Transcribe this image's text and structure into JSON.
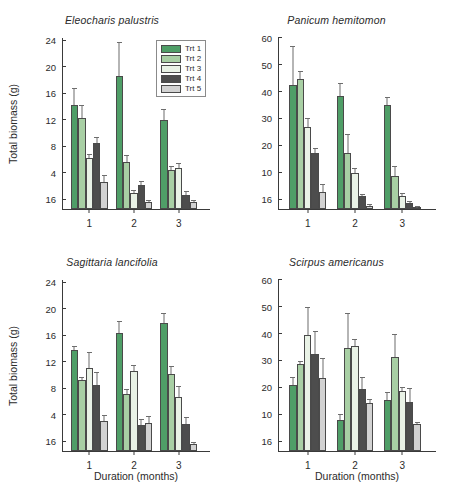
{
  "figure": {
    "legend": {
      "position": "top-right-of-first-panel",
      "entries": [
        {
          "label": "Trt 1",
          "color": "#4f9e67"
        },
        {
          "label": "Trt 2",
          "color": "#a8cfa4"
        },
        {
          "label": "Trt 3",
          "color": "#e9f2e6"
        },
        {
          "label": "Trt 4",
          "color": "#4d4d4d"
        },
        {
          "label": "Trt 5",
          "color": "#d2d2d2"
        }
      ]
    },
    "colors": {
      "trt1": "#4f9e67",
      "trt2": "#a8cfa4",
      "trt3": "#e9f2e6",
      "trt4": "#4d4d4d",
      "trt5": "#d2d2d2",
      "axis": "#3a3a3a",
      "error_bar": "#6d6d6d",
      "background": "#ffffff"
    }
  },
  "chart_data": [
    {
      "type": "bar",
      "panel": "top-left",
      "title": "Eleocharis palustris",
      "xlabel": "",
      "ylabel": "Total biomass (g)",
      "categories": [
        "1",
        "2",
        "3"
      ],
      "xtick_labels": [
        "1",
        "2",
        "3"
      ],
      "ytick_labels": [
        "16",
        "4",
        "8",
        "12",
        "16",
        "20",
        "24"
      ],
      "ylim": [
        0,
        26
      ],
      "yticks": [
        0,
        4,
        8,
        12,
        16,
        20,
        24
      ],
      "grid": false,
      "series": [
        {
          "name": "Trt 1",
          "color": "#4f9e67",
          "values": [
            15.7,
            20.1,
            13.5
          ],
          "errors": [
            2.6,
            5.2,
            1.6
          ]
        },
        {
          "name": "Trt 2",
          "color": "#a8cfa4",
          "values": [
            13.8,
            7.1,
            5.9
          ],
          "errors": [
            1.9,
            1.0,
            0.6
          ]
        },
        {
          "name": "Trt 3",
          "color": "#e9f2e6",
          "values": [
            7.7,
            2.4,
            6.2
          ],
          "errors": [
            0.6,
            0.4,
            0.8
          ]
        },
        {
          "name": "Trt 4",
          "color": "#4d4d4d",
          "values": [
            10.0,
            3.6,
            2.1
          ],
          "errors": [
            0.9,
            0.6,
            0.6
          ]
        },
        {
          "name": "Trt 5",
          "color": "#d2d2d2",
          "values": [
            4.1,
            1.1,
            1.1
          ],
          "errors": [
            1.1,
            0.2,
            0.2
          ]
        }
      ]
    },
    {
      "type": "bar",
      "panel": "top-right",
      "title": "Panicum hemitomon",
      "xlabel": "",
      "ylabel": "",
      "categories": [
        "1",
        "2",
        "3"
      ],
      "xtick_labels": [
        "1",
        "2",
        "3"
      ],
      "ytick_labels": [
        "16",
        "10",
        "20",
        "30",
        "40",
        "50",
        "60"
      ],
      "ylim": [
        0,
        64
      ],
      "yticks": [
        0,
        10,
        20,
        30,
        40,
        50,
        60
      ],
      "grid": false,
      "series": [
        {
          "name": "Trt 1",
          "color": "#4f9e67",
          "values": [
            46.0,
            42.0,
            38.7
          ],
          "errors": [
            14.5,
            4.8,
            3.0
          ]
        },
        {
          "name": "Trt 2",
          "color": "#a8cfa4",
          "values": [
            48.2,
            20.8,
            12.4
          ],
          "errors": [
            3.0,
            7.0,
            3.5
          ]
        },
        {
          "name": "Trt 3",
          "color": "#e9f2e6",
          "values": [
            30.5,
            13.4,
            5.0
          ],
          "errors": [
            3.2,
            1.8,
            0.8
          ]
        },
        {
          "name": "Trt 4",
          "color": "#4d4d4d",
          "values": [
            20.8,
            4.7,
            2.1
          ],
          "errors": [
            2.0,
            0.5,
            0.3
          ]
        },
        {
          "name": "Trt 5",
          "color": "#d2d2d2",
          "values": [
            6.2,
            1.2,
            0.5
          ],
          "errors": [
            3.0,
            0.4,
            0.2
          ]
        }
      ]
    },
    {
      "type": "bar",
      "panel": "bottom-left",
      "title": "Sagittaria lancifolia",
      "xlabel": "Duration (months)",
      "ylabel": "Total biomass (g)",
      "categories": [
        "1",
        "2",
        "3"
      ],
      "xtick_labels": [
        "1",
        "2",
        "3"
      ],
      "ytick_labels": [
        "16",
        "4",
        "8",
        "12",
        "16",
        "20",
        "24"
      ],
      "ylim": [
        0,
        26
      ],
      "yticks": [
        0,
        4,
        8,
        12,
        16,
        20,
        24
      ],
      "grid": false,
      "series": [
        {
          "name": "Trt 1",
          "color": "#4f9e67",
          "values": [
            15.3,
            17.9,
            19.3
          ],
          "errors": [
            0.6,
            1.8,
            1.5
          ]
        },
        {
          "name": "Trt 2",
          "color": "#a8cfa4",
          "values": [
            10.8,
            8.6,
            11.6
          ],
          "errors": [
            0.4,
            0.8,
            1.3
          ]
        },
        {
          "name": "Trt 3",
          "color": "#e9f2e6",
          "values": [
            12.6,
            12.1,
            8.2
          ],
          "errors": [
            2.3,
            0.9,
            1.6
          ]
        },
        {
          "name": "Trt 4",
          "color": "#4d4d4d",
          "values": [
            10.0,
            3.9,
            4.1
          ],
          "errors": [
            2.0,
            0.9,
            1.0
          ]
        },
        {
          "name": "Trt 5",
          "color": "#d2d2d2",
          "values": [
            4.5,
            4.3,
            1.1
          ],
          "errors": [
            1.0,
            1.0,
            0.2
          ]
        }
      ]
    },
    {
      "type": "bar",
      "panel": "bottom-right",
      "title": "Scirpus americanus",
      "xlabel": "Duration (months)",
      "ylabel": "",
      "categories": [
        "1",
        "2",
        "3"
      ],
      "xtick_labels": [
        "1",
        "2",
        "3"
      ],
      "ytick_labels": [
        "16",
        "10",
        "20",
        "30",
        "40",
        "50",
        "60"
      ],
      "ylim": [
        0,
        64
      ],
      "yticks": [
        0,
        10,
        20,
        30,
        40,
        50,
        60
      ],
      "grid": false,
      "series": [
        {
          "name": "Trt 1",
          "color": "#4f9e67",
          "values": [
            24.6,
            11.4,
            18.8
          ],
          "errors": [
            3.0,
            2.5,
            3.0
          ]
        },
        {
          "name": "Trt 2",
          "color": "#a8cfa4",
          "values": [
            32.5,
            38.3,
            34.9
          ],
          "errors": [
            1.0,
            13.0,
            8.5
          ]
        },
        {
          "name": "Trt 3",
          "color": "#e9f2e6",
          "values": [
            43.3,
            39.0,
            22.2
          ],
          "errors": [
            10.3,
            2.5,
            1.8
          ]
        },
        {
          "name": "Trt 4",
          "color": "#4d4d4d",
          "values": [
            36.1,
            23.0,
            18.3
          ],
          "errors": [
            8.5,
            4.5,
            5.0
          ]
        },
        {
          "name": "Trt 5",
          "color": "#d2d2d2",
          "values": [
            27.0,
            18.0,
            10.1
          ],
          "errors": [
            7.5,
            1.5,
            0.5
          ]
        }
      ]
    }
  ]
}
